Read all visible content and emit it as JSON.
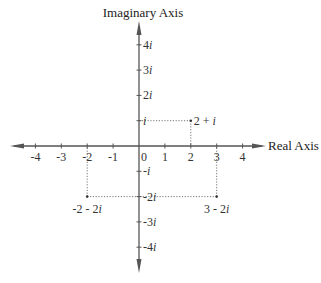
{
  "colors": {
    "axis": "#555555",
    "guide": "#777777",
    "text": "#333333"
  },
  "chart_data": {
    "type": "scatter",
    "title": "",
    "xlabel": "Real Axis",
    "ylabel": "Imaginary Axis",
    "xlim": [
      -4,
      4
    ],
    "ylim": [
      -4,
      4
    ],
    "grid": false,
    "x_ticks": [
      {
        "value": -4,
        "label": "-4"
      },
      {
        "value": -3,
        "label": "-3"
      },
      {
        "value": -2,
        "label": "-2"
      },
      {
        "value": -1,
        "label": "-1"
      },
      {
        "value": 0,
        "label": "0"
      },
      {
        "value": 1,
        "label": "1"
      },
      {
        "value": 2,
        "label": "2"
      },
      {
        "value": 3,
        "label": "3"
      },
      {
        "value": 4,
        "label": "4"
      }
    ],
    "y_ticks": [
      {
        "value": 4,
        "label": "4i"
      },
      {
        "value": 3,
        "label": "3i"
      },
      {
        "value": 2,
        "label": "2i"
      },
      {
        "value": 1,
        "label": "i"
      },
      {
        "value": -1,
        "label": "-i"
      },
      {
        "value": -2,
        "label": "-2i"
      },
      {
        "value": -3,
        "label": "-3i"
      },
      {
        "value": -4,
        "label": "-4i"
      }
    ],
    "points": [
      {
        "re": 2,
        "im": 1,
        "label": "2 + i",
        "label_pos": "right"
      },
      {
        "re": -2,
        "im": -2,
        "label": "-2 - 2i",
        "label_pos": "below"
      },
      {
        "re": 3,
        "im": -2,
        "label": "3 - 2i",
        "label_pos": "below"
      }
    ]
  }
}
